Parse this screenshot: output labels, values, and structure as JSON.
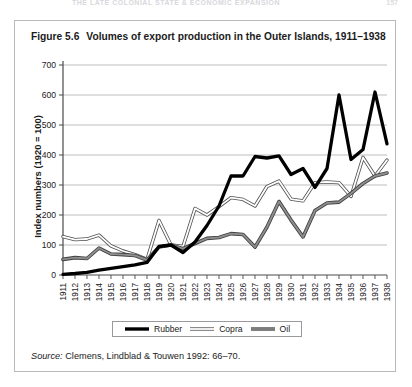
{
  "page": {
    "running_head": "THE LATE COLONIAL STATE & ECONOMIC EXPANSION",
    "folio": "157"
  },
  "figure": {
    "caption_number": "Figure 5.6",
    "caption_text": "Volumes of export production in the Outer Islands, 1911–1938",
    "source_prefix": "Source:",
    "source_text": "Clemens, Lindblad & Touwen 1992: 66–70."
  },
  "legend": {
    "items": [
      {
        "label": "Rubber",
        "color": "#000000",
        "style": "thick-solid"
      },
      {
        "label": "Copra",
        "color": "#ffffff",
        "style": "outline"
      },
      {
        "label": "Oil",
        "color": "#808080",
        "style": "medium-solid"
      }
    ]
  },
  "chart_data": {
    "type": "line",
    "title": "Volumes of export production in the Outer Islands, 1911–1938",
    "xlabel": "",
    "ylabel": "Index numbers (1920 = 100)",
    "ylim": [
      0,
      700
    ],
    "ytick_step": 100,
    "yticks": [
      0,
      100,
      200,
      300,
      400,
      500,
      600,
      700
    ],
    "grid": true,
    "legend_position": "bottom",
    "categories": [
      "1911",
      "1912",
      "1913",
      "1914",
      "1915",
      "1916",
      "1917",
      "1918",
      "1919",
      "1920",
      "1921",
      "1922",
      "1923",
      "1924",
      "1925",
      "1926",
      "1927",
      "1928",
      "1929",
      "1930",
      "1931",
      "1932",
      "1933",
      "1934",
      "1935",
      "1936",
      "1937",
      "1938"
    ],
    "series": [
      {
        "name": "Rubber",
        "color": "#000000",
        "values": [
          2,
          5,
          9,
          16,
          22,
          28,
          34,
          42,
          95,
          100,
          75,
          110,
          165,
          230,
          330,
          330,
          395,
          390,
          397,
          335,
          355,
          292,
          355,
          600,
          385,
          418,
          610,
          437
        ]
      },
      {
        "name": "Copra",
        "color": "#ffffff",
        "values": [
          128,
          118,
          120,
          133,
          97,
          80,
          68,
          52,
          182,
          100,
          95,
          222,
          200,
          228,
          258,
          252,
          230,
          295,
          313,
          253,
          247,
          308,
          310,
          308,
          262,
          392,
          330,
          383
        ]
      },
      {
        "name": "Oil",
        "color": "#808080",
        "values": [
          52,
          58,
          55,
          90,
          70,
          68,
          65,
          50,
          93,
          100,
          88,
          105,
          122,
          125,
          138,
          135,
          93,
          160,
          245,
          183,
          127,
          215,
          240,
          243,
          272,
          305,
          330,
          340
        ]
      }
    ]
  }
}
